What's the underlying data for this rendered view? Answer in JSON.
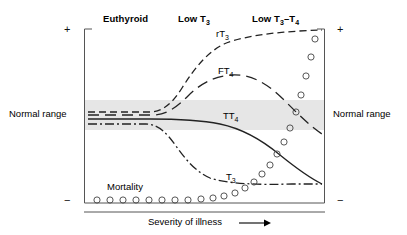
{
  "figure": {
    "stages": [
      {
        "label_main": "Euthyroid",
        "label_sub": "",
        "label_tail": "",
        "x": 103,
        "y": 13
      },
      {
        "label_main": "Low T",
        "label_sub": "3",
        "label_tail": "",
        "x": 178,
        "y": 13
      },
      {
        "label_main": "Low T",
        "label_sub": "3",
        "label_tail": "–T",
        "label_sub2": "4",
        "x": 252,
        "y": 13
      }
    ],
    "axis": {
      "plus_left": "+",
      "plus_right": "+",
      "minus_left": "−",
      "minus_right": "−",
      "normal_range_left": "Normal range",
      "normal_range_right": "Normal range",
      "x_axis_title": "Severity of illness"
    },
    "curves": [
      {
        "name": "rT3",
        "label_main": "rT",
        "label_sub": "3",
        "style": "dashed",
        "label_x": 216,
        "label_y": 28
      },
      {
        "name": "FT4",
        "label_main": "FT",
        "label_sub": "4",
        "style": "long-dashed",
        "label_x": 218,
        "label_y": 65
      },
      {
        "name": "TT4",
        "label_main": "TT",
        "label_sub": "4",
        "style": "solid",
        "label_x": 223,
        "label_y": 110
      },
      {
        "name": "T3",
        "label_main": "T",
        "label_sub": "3",
        "style": "dash-dot",
        "label_x": 226,
        "label_y": 171
      }
    ],
    "mortality": {
      "label": "Mortality",
      "label_x": 107,
      "label_y": 181
    }
  },
  "chart_data": {
    "type": "line",
    "title": "",
    "xlabel": "Severity of illness",
    "ylabel": "",
    "grid": false,
    "legend": "inline-curve-labels",
    "x_axis": {
      "categories": [
        "Euthyroid",
        "Low T3",
        "Low T3–T4"
      ],
      "range_note": "increasing severity of illness, left to right, unitless"
    },
    "y_axis": {
      "top_marker": "+",
      "bottom_marker": "−",
      "band_label": "Normal range",
      "band_top_value": 0.62,
      "band_bottom_value": 0.38,
      "range_note": "relative hormone concentration, unitless"
    },
    "series": [
      {
        "name": "rT3",
        "display_label": "rT₃",
        "style": "dashed",
        "description": "Reverse T3 rises sharply above normal range and plateaus high",
        "x": [
          0,
          10,
          20,
          30,
          40,
          50,
          60,
          70,
          80,
          90,
          100
        ],
        "y": [
          0.56,
          0.56,
          0.57,
          0.62,
          0.74,
          0.84,
          0.9,
          0.93,
          0.95,
          0.96,
          0.96
        ]
      },
      {
        "name": "FT4",
        "display_label": "FT₄",
        "style": "long-dashed",
        "description": "Free T4 rises moderately then declines back toward normal range",
        "x": [
          0,
          10,
          20,
          30,
          40,
          50,
          60,
          70,
          80,
          90,
          100
        ],
        "y": [
          0.54,
          0.54,
          0.55,
          0.6,
          0.68,
          0.73,
          0.74,
          0.71,
          0.64,
          0.54,
          0.44
        ]
      },
      {
        "name": "TT4",
        "display_label": "TT₄",
        "style": "solid",
        "description": "Total T4 stays near normal then declines progressively below range",
        "x": [
          0,
          10,
          20,
          30,
          40,
          50,
          60,
          70,
          80,
          90,
          100
        ],
        "y": [
          0.5,
          0.5,
          0.5,
          0.5,
          0.49,
          0.47,
          0.43,
          0.37,
          0.29,
          0.21,
          0.14
        ]
      },
      {
        "name": "T3",
        "display_label": "T₃",
        "style": "dash-dot",
        "description": "Total T3 falls steeply below normal range early then plateaus low",
        "x": [
          0,
          10,
          20,
          30,
          40,
          50,
          60,
          70,
          80,
          90,
          100
        ],
        "y": [
          0.46,
          0.46,
          0.45,
          0.38,
          0.28,
          0.19,
          0.13,
          0.1,
          0.09,
          0.09,
          0.09
        ]
      },
      {
        "name": "Mortality",
        "display_label": "Mortality",
        "style": "open-circles",
        "description": "Mortality flat and low through early illness, rising steeply in Low T3–T4",
        "x": [
          4,
          10,
          16,
          22,
          28,
          34,
          40,
          46,
          52,
          58,
          63,
          68,
          72,
          76,
          79,
          82,
          85,
          88,
          90,
          92,
          94
        ],
        "y": [
          0.02,
          0.02,
          0.02,
          0.02,
          0.02,
          0.02,
          0.02,
          0.02,
          0.03,
          0.03,
          0.04,
          0.06,
          0.09,
          0.13,
          0.19,
          0.27,
          0.36,
          0.47,
          0.6,
          0.74,
          0.88
        ]
      }
    ],
    "annotations": [
      {
        "text": "Euthyroid",
        "x": 12,
        "y": 1.05
      },
      {
        "text": "Low T₃",
        "x": 42,
        "y": 1.05
      },
      {
        "text": "Low T₃–T₄",
        "x": 73,
        "y": 1.05
      }
    ]
  }
}
